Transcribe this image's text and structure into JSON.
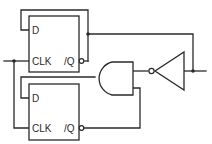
{
  "diagram": {
    "type": "logic-circuit",
    "components": {
      "flipflop_top": {
        "d_label": "D",
        "clk_label": "CLK",
        "qbar_label": "/Q"
      },
      "flipflop_bottom": {
        "d_label": "D",
        "clk_label": "CLK",
        "qbar_label": "/Q"
      },
      "and_gate": {
        "kind": "AND"
      },
      "inverter": {
        "kind": "NOT"
      }
    },
    "colors": {
      "line": "#2a2a2a",
      "background": "#ffffff"
    }
  }
}
